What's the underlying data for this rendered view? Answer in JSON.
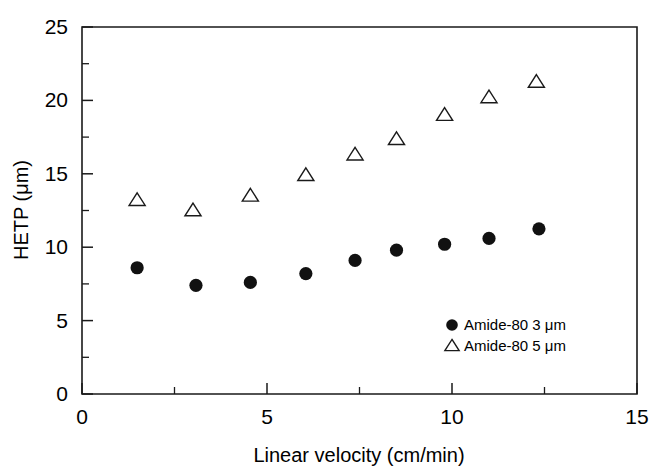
{
  "chart_data": {
    "type": "scatter",
    "title": "",
    "xlabel": "Linear velocity (cm/min)",
    "ylabel": "HETP (μm)",
    "xlim": [
      0,
      15
    ],
    "ylim": [
      0,
      25
    ],
    "xticks": [
      0,
      5,
      10,
      15
    ],
    "yticks": [
      0,
      5,
      10,
      15,
      20,
      25
    ],
    "xticklabels": [
      "0",
      "5",
      "10",
      "15"
    ],
    "yticklabels": [
      "0",
      "5",
      "10",
      "15",
      "20",
      "25"
    ],
    "x_minor_ticks": [
      2.5,
      7.5,
      12.5
    ],
    "y_minor_ticks": [
      2.5,
      7.5,
      12.5,
      17.5,
      22.5
    ],
    "grid": false,
    "legend_position": "lower right",
    "series": [
      {
        "name": "Amide-80 3 μm",
        "marker": "filled-circle",
        "color": "#111111",
        "x": [
          1.49,
          3.08,
          4.55,
          6.05,
          7.38,
          8.5,
          9.8,
          11.0,
          12.35
        ],
        "y": [
          8.6,
          7.4,
          7.6,
          8.2,
          9.1,
          9.8,
          10.2,
          10.6,
          11.25
        ]
      },
      {
        "name": "Amide-80 5 μm",
        "marker": "open-triangle",
        "color": "#1a1a1a",
        "x": [
          1.49,
          3.0,
          4.55,
          6.05,
          7.38,
          8.5,
          9.8,
          11.0,
          12.28
        ],
        "y": [
          13.2,
          12.5,
          13.5,
          14.9,
          16.3,
          17.35,
          19.0,
          20.2,
          21.25
        ]
      }
    ]
  },
  "legend": {
    "entries": [
      {
        "label": "Amide-80 3 μm",
        "marker": "filled-circle-icon"
      },
      {
        "label": "Amide-80 5 μm",
        "marker": "open-triangle-icon"
      }
    ]
  },
  "axes": {
    "x_title": "Linear velocity (cm/min)",
    "y_title": "HETP (μm)",
    "x_labels": [
      "0",
      "5",
      "10",
      "15"
    ],
    "y_labels": [
      "0",
      "5",
      "10",
      "15",
      "20",
      "25"
    ]
  }
}
